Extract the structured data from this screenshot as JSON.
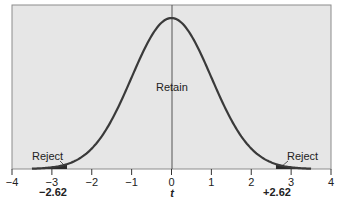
{
  "chart_data": {
    "type": "line",
    "title": "",
    "xlabel": "t",
    "ylabel": "",
    "xlim": [
      -4,
      4
    ],
    "x_ticks": [
      -4,
      -3,
      -2,
      -1,
      0,
      1,
      2,
      3,
      4
    ],
    "x_tick_labels": [
      "−4",
      "−3",
      "−2",
      "−1",
      "0",
      "1",
      "2",
      "3",
      "4"
    ],
    "grid": false,
    "legend": null,
    "series": [
      {
        "name": "t distribution (density)",
        "curve": "bell",
        "center": 0,
        "x_range": [
          -3.5,
          3.5
        ]
      }
    ],
    "critical_values": [
      -2.62,
      2.62
    ],
    "critical_labels": [
      "−2.62",
      "+2.62"
    ],
    "annotations": [
      {
        "text": "Reject",
        "region": "left tail",
        "x_range": [
          -3.5,
          -2.62
        ]
      },
      {
        "text": "Retain",
        "region": "center",
        "x_range": [
          -2.62,
          2.62
        ]
      },
      {
        "text": "Reject",
        "region": "right tail",
        "x_range": [
          2.62,
          3.5
        ]
      }
    ]
  },
  "labels": {
    "x_axis_title": "t",
    "retain": "Retain",
    "reject_left": "Reject",
    "reject_right": "Reject",
    "crit_left": "−2.62",
    "crit_right": "+2.62",
    "ticks": [
      "−4",
      "−3",
      "−2",
      "−1",
      "0",
      "1",
      "2",
      "3",
      "4"
    ]
  },
  "colors": {
    "plot_background": "#e6e6e6",
    "curve": "#3a3a3a",
    "tail_shading": "#2a2a2a",
    "frame": "#8c8c8c"
  }
}
